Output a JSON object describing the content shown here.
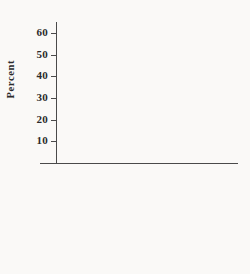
{
  "chart_data": {
    "type": "bar",
    "title": "",
    "xlabel": "",
    "ylabel": "Percent",
    "categories": [
      "Republicans",
      "Democrats"
    ],
    "series": [
      {
        "name": "Liberal",
        "values": [
          4,
          23
        ],
        "color": "#8e8e8e"
      },
      {
        "name": "Moderate",
        "values": [
          40,
          51
        ],
        "color": "#6e6e6e"
      },
      {
        "name": "Conservative",
        "values": [
          56,
          25
        ],
        "color": "#c2c2c2"
      }
    ],
    "ylim": [
      0,
      65
    ],
    "yticks": [
      10,
      20,
      30,
      40,
      50,
      60
    ],
    "ytick_labels": [
      "10",
      "20",
      "30",
      "40",
      "50",
      "60"
    ],
    "grid": false,
    "legend_position": "below"
  },
  "axis": {
    "y_title": "Percent",
    "ticks": [
      {
        "label": "60",
        "value": 60
      },
      {
        "label": "50",
        "value": 50
      },
      {
        "label": "40",
        "value": 40
      },
      {
        "label": "30",
        "value": 30
      },
      {
        "label": "20",
        "value": 20
      },
      {
        "label": "10",
        "value": 10
      }
    ]
  },
  "categories": [
    {
      "label": "Republicans"
    },
    {
      "label": "Democrats"
    }
  ],
  "legend": {
    "items": [
      {
        "label": "Liberal",
        "color": "#8e8e8e"
      },
      {
        "label": "Moderate",
        "color": "#6e6e6e"
      },
      {
        "label": "Conservative",
        "color": "#c2c2c2"
      }
    ]
  },
  "colors": {
    "background": "#faf9f7",
    "axis": "#4a4a4a",
    "text": "#2b2b2b",
    "liberal": "#8e8e8e",
    "moderate": "#6e6e6e",
    "conservative": "#c2c2c2"
  }
}
